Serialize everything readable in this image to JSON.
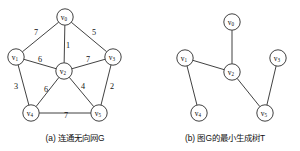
{
  "figure": {
    "panels": [
      {
        "id": "graph-g",
        "caption": "(a) 连通无向网G",
        "nodes": [
          {
            "id": "v0",
            "label": "v",
            "sub": "0",
            "x": 65,
            "y": 17
          },
          {
            "id": "v1",
            "label": "v",
            "sub": "1",
            "x": 16,
            "y": 57
          },
          {
            "id": "v2",
            "label": "v",
            "sub": "2",
            "x": 64,
            "y": 71
          },
          {
            "id": "v3",
            "label": "v",
            "sub": "3",
            "x": 113,
            "y": 57
          },
          {
            "id": "v4",
            "label": "v",
            "sub": "4",
            "x": 31,
            "y": 113
          },
          {
            "id": "v5",
            "label": "v",
            "sub": "5",
            "x": 99,
            "y": 113
          }
        ],
        "edges": [
          {
            "from": "v0",
            "to": "v1",
            "weight": "7",
            "lx": 36,
            "ly": 32
          },
          {
            "from": "v0",
            "to": "v3",
            "weight": "5",
            "lx": 94,
            "ly": 32
          },
          {
            "from": "v0",
            "to": "v2",
            "weight": "1",
            "lx": 68,
            "ly": 45
          },
          {
            "from": "v1",
            "to": "v2",
            "weight": "6",
            "lx": 40,
            "ly": 59
          },
          {
            "from": "v2",
            "to": "v3",
            "weight": "7",
            "lx": 88,
            "ly": 59
          },
          {
            "from": "v1",
            "to": "v4",
            "weight": "3",
            "lx": 16,
            "ly": 86
          },
          {
            "from": "v2",
            "to": "v4",
            "weight": "6",
            "lx": 46,
            "ly": 89
          },
          {
            "from": "v2",
            "to": "v5",
            "weight": "4",
            "lx": 83,
            "ly": 86
          },
          {
            "from": "v3",
            "to": "v5",
            "weight": "2",
            "lx": 112,
            "ly": 86
          },
          {
            "from": "v4",
            "to": "v5",
            "weight": "7",
            "lx": 66,
            "ly": 115
          }
        ]
      },
      {
        "id": "mst-t",
        "caption": "(b) 图G的最小生成树T",
        "nodes": [
          {
            "id": "v0",
            "label": "v",
            "sub": "0",
            "x": 82,
            "y": 22
          },
          {
            "id": "v1",
            "label": "v",
            "sub": "1",
            "x": 35,
            "y": 58
          },
          {
            "id": "v2",
            "label": "v",
            "sub": "2",
            "x": 82,
            "y": 72
          },
          {
            "id": "v3",
            "label": "v",
            "sub": "3",
            "x": 128,
            "y": 58
          },
          {
            "id": "v4",
            "label": "v",
            "sub": "4",
            "x": 49,
            "y": 113
          },
          {
            "id": "v5",
            "label": "v",
            "sub": "5",
            "x": 115,
            "y": 113
          }
        ],
        "edges": [
          {
            "from": "v0",
            "to": "v2",
            "weight": "",
            "lx": 0,
            "ly": 0
          },
          {
            "from": "v1",
            "to": "v2",
            "weight": "",
            "lx": 0,
            "ly": 0
          },
          {
            "from": "v1",
            "to": "v4",
            "weight": "",
            "lx": 0,
            "ly": 0
          },
          {
            "from": "v2",
            "to": "v5",
            "weight": "",
            "lx": 0,
            "ly": 0
          },
          {
            "from": "v3",
            "to": "v5",
            "weight": "",
            "lx": 0,
            "ly": 0
          }
        ]
      }
    ],
    "node_radius": 8.2,
    "colors": {
      "stroke": "#2b2b2b",
      "node_fill": "#ffffff",
      "text": "#111111",
      "background": "#ffffff"
    }
  },
  "chart_data": {
    "type": "diagram",
    "title": "",
    "graphs": [
      {
        "name": "(a) 连通无向网G",
        "kind": "undirected-weighted-graph",
        "vertices": [
          "v0",
          "v1",
          "v2",
          "v3",
          "v4",
          "v5"
        ],
        "edges": [
          {
            "u": "v0",
            "v": "v1",
            "w": 7
          },
          {
            "u": "v0",
            "v": "v2",
            "w": 1
          },
          {
            "u": "v0",
            "v": "v3",
            "w": 5
          },
          {
            "u": "v1",
            "v": "v2",
            "w": 6
          },
          {
            "u": "v1",
            "v": "v4",
            "w": 3
          },
          {
            "u": "v2",
            "v": "v3",
            "w": 7
          },
          {
            "u": "v2",
            "v": "v4",
            "w": 6
          },
          {
            "u": "v2",
            "v": "v5",
            "w": 4
          },
          {
            "u": "v3",
            "v": "v5",
            "w": 2
          },
          {
            "u": "v4",
            "v": "v5",
            "w": 7
          }
        ]
      },
      {
        "name": "(b) 图G的最小生成树T",
        "kind": "minimum-spanning-tree",
        "vertices": [
          "v0",
          "v1",
          "v2",
          "v3",
          "v4",
          "v5"
        ],
        "edges": [
          {
            "u": "v0",
            "v": "v2",
            "w": 1
          },
          {
            "u": "v1",
            "v": "v2",
            "w": 6
          },
          {
            "u": "v1",
            "v": "v4",
            "w": 3
          },
          {
            "u": "v2",
            "v": "v5",
            "w": 4
          },
          {
            "u": "v3",
            "v": "v5",
            "w": 2
          }
        ]
      }
    ]
  }
}
